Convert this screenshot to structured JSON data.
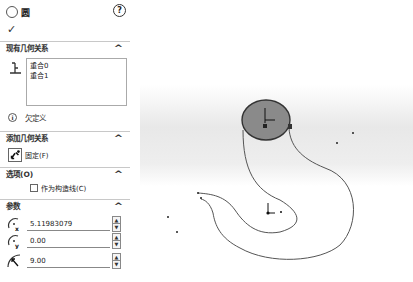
{
  "header": {
    "title": "圆",
    "help_icon": "?",
    "ok_icon": "✓"
  },
  "sections": {
    "existing_relations": {
      "title": "现有几何关系",
      "chevron": "^",
      "items": [
        "重合0",
        "重合1"
      ]
    },
    "status": {
      "icon": "i",
      "text": "欠定义"
    },
    "add_relations": {
      "title": "添加几何关系",
      "chevron": "^",
      "fix_label": "固定(F)"
    },
    "options": {
      "title": "选项(O)",
      "chevron": "^",
      "construction_label": "作为构造线(C)",
      "construction_checked": false
    },
    "parameters": {
      "title": "参数",
      "chevron": "^",
      "center_x": "5.11983079",
      "center_y": "0.00",
      "radius": "9.00",
      "spin_up": "▲",
      "spin_down": "▼"
    }
  },
  "canvas": {
    "circle_fill": "#8a8a8a",
    "curve_color": "#555555",
    "background_gradient": [
      "#ffffff",
      "#e4e4e4"
    ]
  }
}
